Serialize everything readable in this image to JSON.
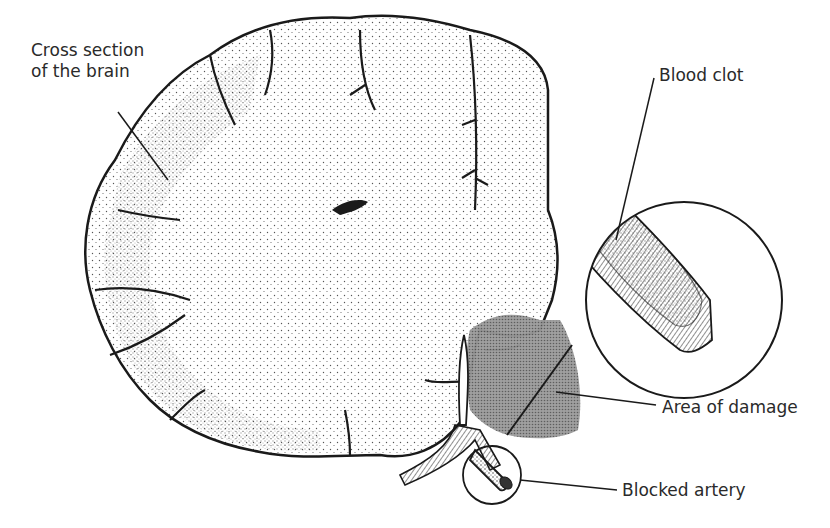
{
  "diagram": {
    "labels": {
      "cross_section": "Cross section of the brain",
      "blood_clot": "Blood clot",
      "area_of_damage": "Area of damage",
      "blocked_artery": "Blocked artery"
    },
    "colors": {
      "ink": "#1a1a1a",
      "text": "#2a2a2a",
      "damage_fill": "#8a8a8a",
      "stipple": "#555555",
      "background": "#ffffff"
    }
  }
}
